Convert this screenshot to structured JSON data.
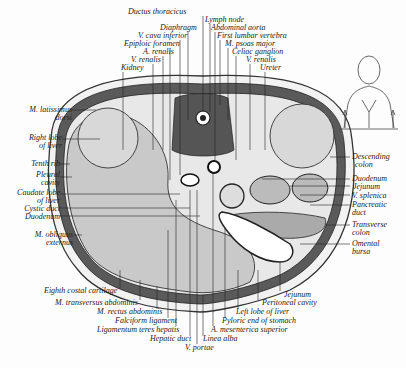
{
  "figure": {
    "type": "anatomical transverse section of abdomen at first lumbar vertebra",
    "colors": {
      "muscle": "#555555",
      "liver": "#c9c9c9",
      "background": "#fdfdfd",
      "fat": "#eeeeee",
      "line": "#222222"
    }
  },
  "labels_top": [
    {
      "text": "Ductus thoracicus",
      "x": 128,
      "y": 14
    },
    {
      "text": "Lymph node",
      "x": 203,
      "y": 21
    },
    {
      "text": "Diaphragm",
      "x": 160,
      "y": 29
    },
    {
      "text": "Abdominal aorta",
      "x": 210,
      "y": 29
    },
    {
      "text": "V. cava inferior",
      "x": 140,
      "y": 37
    },
    {
      "text": "First lumbar vertebra",
      "x": 217,
      "y": 37
    },
    {
      "text": "Epiploic foramen",
      "x": 125,
      "y": 45
    },
    {
      "text": "M. psoas major",
      "x": 224,
      "y": 45
    },
    {
      "text": "A. renalis",
      "x": 143,
      "y": 53
    },
    {
      "text": "Celiac ganglion",
      "x": 232,
      "y": 53
    },
    {
      "text": "V. renalis",
      "x": 130,
      "y": 61
    },
    {
      "text": "V. renalis",
      "x": 246,
      "y": 61
    },
    {
      "text": "Kidney",
      "x": 120,
      "y": 69
    },
    {
      "text": "Ureter",
      "x": 260,
      "y": 69
    }
  ],
  "labels_left": [
    {
      "text": "M. latissimus",
      "x": 2,
      "y": 108,
      "w": 70
    },
    {
      "text": "dorsi",
      "x": 2,
      "y": 116,
      "w": 70
    },
    {
      "text": "Right lobe",
      "x": 2,
      "y": 135,
      "w": 60
    },
    {
      "text": "of liver",
      "x": 2,
      "y": 143,
      "w": 60
    },
    {
      "text": "Tenth rib",
      "x": 2,
      "y": 162,
      "w": 57
    },
    {
      "text": "Pleural",
      "x": 2,
      "y": 173,
      "w": 57
    },
    {
      "text": "cavity",
      "x": 2,
      "y": 181,
      "w": 57
    },
    {
      "text": "Caudate lobe",
      "x": 2,
      "y": 190,
      "w": 57
    },
    {
      "text": "of liver",
      "x": 2,
      "y": 198,
      "w": 57
    },
    {
      "text": "Cystic duct",
      "x": 2,
      "y": 206,
      "w": 57
    },
    {
      "text": "Duodenum",
      "x": 2,
      "y": 214,
      "w": 57
    },
    {
      "text": "M. obliquus",
      "x": 2,
      "y": 231,
      "w": 71
    },
    {
      "text": "externus",
      "x": 2,
      "y": 239,
      "w": 71
    }
  ],
  "labels_right": [
    {
      "text": "Descending",
      "x": 352,
      "y": 153
    },
    {
      "text": "colon",
      "x": 355,
      "y": 161
    },
    {
      "text": "Duodenum",
      "x": 352,
      "y": 176
    },
    {
      "text": "Jejunum",
      "x": 353,
      "y": 184
    },
    {
      "text": "V. splenica",
      "x": 352,
      "y": 193
    },
    {
      "text": "Pancreatic",
      "x": 352,
      "y": 202
    },
    {
      "text": "duct",
      "x": 352,
      "y": 210
    },
    {
      "text": "Transverse",
      "x": 352,
      "y": 221
    },
    {
      "text": "colon",
      "x": 352,
      "y": 229
    },
    {
      "text": "Omental",
      "x": 352,
      "y": 240
    },
    {
      "text": "bursa",
      "x": 352,
      "y": 248
    }
  ],
  "labels_bottom": [
    {
      "text": "Eighth costal cartilage",
      "x": 45,
      "y": 290
    },
    {
      "text": "Jejunum",
      "x": 283,
      "y": 293
    },
    {
      "text": "M. transversus abdominis",
      "x": 56,
      "y": 302
    },
    {
      "text": "Peritoneal cavity",
      "x": 262,
      "y": 302
    },
    {
      "text": "M. rectus abdominis",
      "x": 97,
      "y": 311
    },
    {
      "text": "Left lobe of liver",
      "x": 236,
      "y": 311
    },
    {
      "text": "Falciform ligament",
      "x": 115,
      "y": 320
    },
    {
      "text": "Pyloric end of stomach",
      "x": 222,
      "y": 320
    },
    {
      "text": "Ligamentum teres hepatis",
      "x": 98,
      "y": 329
    },
    {
      "text": "A. mesenterica superior",
      "x": 211,
      "y": 329
    },
    {
      "text": "Hepatic duct",
      "x": 150,
      "y": 338
    },
    {
      "text": "Linea alba",
      "x": 203,
      "y": 338
    },
    {
      "text": "V. portae",
      "x": 185,
      "y": 347
    }
  ],
  "orientation_figure": {
    "label": "torso outline with arrows indicating section level"
  }
}
